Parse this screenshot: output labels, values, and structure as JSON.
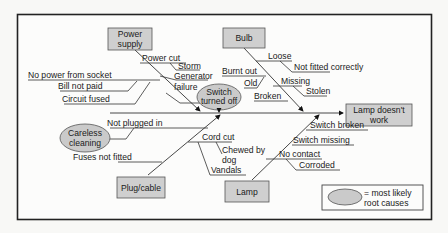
{
  "diagram": {
    "type": "fishbone",
    "effect": {
      "line1": "Lamp doesn't",
      "line2": "work"
    },
    "categories": {
      "power_supply": {
        "line1": "Power",
        "line2": "supply"
      },
      "bulb": {
        "label": "Bulb"
      },
      "plug_cable": {
        "label": "Plug/cable"
      },
      "lamp": {
        "label": "Lamp"
      }
    },
    "causes": {
      "power_cut": "Power cut",
      "storm": "Storm",
      "generator_1": "Generator",
      "generator_2": "failure",
      "no_power": "No power from socket",
      "bill": "Bill not paid",
      "circuit": "Circuit fused",
      "switch_off_1": "Switch",
      "switch_off_2": "turned off",
      "loose": "Loose",
      "not_fitted": "Not fitted correctly",
      "burnt": "Burnt out",
      "old": "Old",
      "missing": "Missing",
      "stolen": "Stolen",
      "broken": "Broken",
      "not_plugged": "Not plugged in",
      "careless_1": "Careless",
      "careless_2": "cleaning",
      "fuses": "Fuses not fitted",
      "cord_cut": "Cord cut",
      "chewed_1": "Chewed by",
      "chewed_2": "dog",
      "vandals": "Vandals",
      "switch_broken": "Switch broken",
      "switch_missing": "Switch missing",
      "no_contact": "No contact",
      "corroded": "Corroded"
    },
    "legend": {
      "line1": "= most likely",
      "line2": "root causes"
    },
    "colors": {
      "box_fill": "#cfcfcf",
      "root_cause_fill": "#cacaca",
      "frame": "#222222"
    }
  }
}
